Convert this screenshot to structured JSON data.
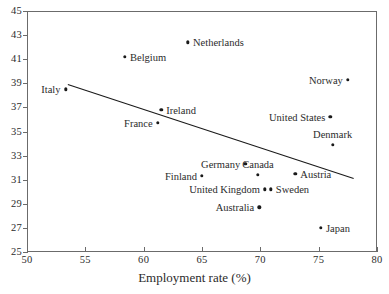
{
  "chart_data": {
    "type": "scatter",
    "title": "",
    "xlabel": "Employment rate (%)",
    "ylabel": "",
    "xlim": [
      50,
      80
    ],
    "ylim": [
      25,
      45
    ],
    "xticks": [
      "50",
      "55",
      "60",
      "65",
      "70",
      "75",
      "80"
    ],
    "yticks": [
      "45",
      "43",
      "41",
      "39",
      "37",
      "35",
      "33",
      "31",
      "29",
      "27",
      "25"
    ],
    "grid": false,
    "legend": "none",
    "points": [
      {
        "label": "Italy",
        "x": 53.3,
        "y": 38.5,
        "label_side": "left"
      },
      {
        "label": "Belgium",
        "x": 58.4,
        "y": 41.2,
        "label_side": "right"
      },
      {
        "label": "Netherlands",
        "x": 63.8,
        "y": 42.4,
        "label_side": "right"
      },
      {
        "label": "Norway",
        "x": 77.5,
        "y": 39.3,
        "label_side": "left"
      },
      {
        "label": "Ireland",
        "x": 61.5,
        "y": 36.8,
        "label_side": "right"
      },
      {
        "label": "United States",
        "x": 76.0,
        "y": 36.2,
        "label_side": "left"
      },
      {
        "label": "France",
        "x": 61.2,
        "y": 35.7,
        "label_side": "left"
      },
      {
        "label": "Denmark",
        "x": 76.2,
        "y": 33.9,
        "label_side": "above"
      },
      {
        "label": "Germany",
        "x": 68.7,
        "y": 32.3,
        "label_side": "left"
      },
      {
        "label": "Canada",
        "x": 69.8,
        "y": 31.4,
        "label_side": "above"
      },
      {
        "label": "Austria",
        "x": 73.0,
        "y": 31.5,
        "label_side": "right"
      },
      {
        "label": "Finland",
        "x": 65.0,
        "y": 31.3,
        "label_side": "left"
      },
      {
        "label": "United Kingdom",
        "x": 70.4,
        "y": 30.2,
        "label_side": "left"
      },
      {
        "label": "Sweden",
        "x": 70.9,
        "y": 30.2,
        "label_side": "right"
      },
      {
        "label": "Australia",
        "x": 69.9,
        "y": 28.7,
        "label_side": "left"
      },
      {
        "label": "Japan",
        "x": 75.2,
        "y": 27.0,
        "label_side": "right"
      }
    ],
    "trendline": {
      "x0": 53.5,
      "y0": 38.9,
      "x1": 78.0,
      "y1": 31.1
    },
    "colors": {
      "marker": "#1a1a1a",
      "axis": "#6b6b6b",
      "line": "#1a1a1a",
      "text": "#2b2b2b"
    }
  }
}
